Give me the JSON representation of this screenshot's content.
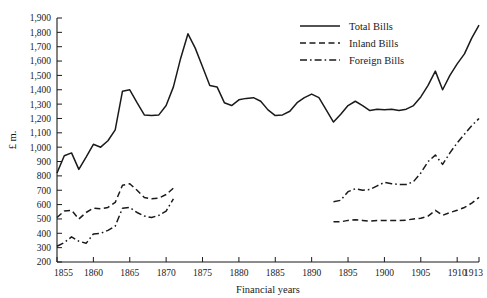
{
  "chart_data": {
    "type": "line",
    "title": "",
    "xlabel": "Financial years",
    "ylabel": "£ m.",
    "xlim": [
      1855,
      1913
    ],
    "ylim": [
      200,
      1900
    ],
    "ytick_step": 100,
    "grid": false,
    "legend_position": "top-right",
    "xticks": [
      1855,
      1860,
      1865,
      1870,
      1875,
      1880,
      1885,
      1890,
      1895,
      1900,
      1905,
      1910,
      1913
    ],
    "xtick_labels": [
      "1855",
      "1860",
      "1865",
      "1870",
      "1875",
      "1880",
      "1885",
      "1890",
      "1895",
      "1900",
      "1905",
      "1910",
      "1913"
    ],
    "yticks": [
      200,
      300,
      400,
      500,
      600,
      700,
      800,
      900,
      1000,
      1100,
      1200,
      1300,
      1400,
      1500,
      1600,
      1700,
      1800,
      1900
    ],
    "ytick_labels": [
      "200",
      "300",
      "400",
      "500",
      "600",
      "700",
      "800",
      "900",
      "1,000",
      "1,100",
      "1,200",
      "1,300",
      "1,400",
      "1,500",
      "1,600",
      "1,700",
      "1,800",
      "1,900"
    ],
    "series": [
      {
        "name": "Total Bills",
        "style": "solid",
        "x": [
          1855,
          1856,
          1857,
          1858,
          1859,
          1860,
          1861,
          1862,
          1863,
          1864,
          1865,
          1866,
          1867,
          1868,
          1869,
          1870,
          1871,
          1872,
          1873,
          1874,
          1875,
          1876,
          1877,
          1878,
          1879,
          1880,
          1881,
          1882,
          1883,
          1884,
          1885,
          1886,
          1887,
          1888,
          1889,
          1890,
          1891,
          1892,
          1893,
          1894,
          1895,
          1896,
          1897,
          1898,
          1899,
          1900,
          1901,
          1902,
          1903,
          1904,
          1905,
          1906,
          1907,
          1908,
          1909,
          1910,
          1911,
          1912,
          1913
        ],
        "values": [
          820,
          940,
          960,
          845,
          930,
          1020,
          1000,
          1045,
          1120,
          1390,
          1400,
          1310,
          1225,
          1220,
          1225,
          1290,
          1420,
          1620,
          1790,
          1690,
          1560,
          1430,
          1420,
          1310,
          1290,
          1330,
          1340,
          1345,
          1320,
          1260,
          1220,
          1225,
          1250,
          1310,
          1345,
          1370,
          1345,
          1260,
          1175,
          1230,
          1290,
          1320,
          1290,
          1255,
          1265,
          1260,
          1265,
          1255,
          1265,
          1290,
          1350,
          1430,
          1530,
          1400,
          1500,
          1580,
          1650,
          1760,
          1850
        ]
      },
      {
        "name": "Inland Bills",
        "style": "dashed",
        "segments": [
          {
            "x": [
              1855,
              1856,
              1857,
              1858,
              1859,
              1860,
              1861,
              1862,
              1863,
              1864,
              1865,
              1866,
              1867,
              1868,
              1869,
              1870,
              1871
            ],
            "values": [
              510,
              555,
              560,
              500,
              545,
              575,
              570,
              580,
              615,
              735,
              745,
              700,
              650,
              640,
              645,
              670,
              715
            ]
          },
          {
            "x": [
              1893,
              1894,
              1895,
              1896,
              1897,
              1898,
              1899,
              1900,
              1901,
              1902,
              1903,
              1904,
              1905,
              1906,
              1907,
              1908,
              1909,
              1910,
              1911,
              1912,
              1913
            ],
            "values": [
              480,
              480,
              490,
              495,
              490,
              485,
              490,
              490,
              490,
              488,
              492,
              500,
              505,
              520,
              560,
              525,
              545,
              560,
              580,
              610,
              650
            ]
          }
        ]
      },
      {
        "name": "Foreign Bills",
        "style": "dashdot",
        "segments": [
          {
            "x": [
              1855,
              1856,
              1857,
              1858,
              1859,
              1860,
              1861,
              1862,
              1863,
              1864,
              1865,
              1866,
              1867,
              1868,
              1869,
              1870,
              1871
            ],
            "values": [
              310,
              335,
              375,
              345,
              330,
              395,
              400,
              420,
              450,
              575,
              580,
              545,
              520,
              510,
              525,
              555,
              640
            ]
          },
          {
            "x": [
              1893,
              1894,
              1895,
              1896,
              1897,
              1898,
              1899,
              1900,
              1901,
              1902,
              1903,
              1904,
              1905,
              1906,
              1907,
              1908,
              1909,
              1910,
              1911,
              1912,
              1913
            ],
            "values": [
              620,
              630,
              690,
              710,
              700,
              705,
              730,
              755,
              745,
              740,
              740,
              760,
              820,
              900,
              945,
              880,
              960,
              1030,
              1090,
              1150,
              1200
            ]
          }
        ]
      }
    ]
  },
  "legend": {
    "items": [
      {
        "label": "Total Bills",
        "style": "solid"
      },
      {
        "label": "Inland Bills",
        "style": "dashed"
      },
      {
        "label": "Foreign Bills",
        "style": "dashdot"
      }
    ]
  }
}
